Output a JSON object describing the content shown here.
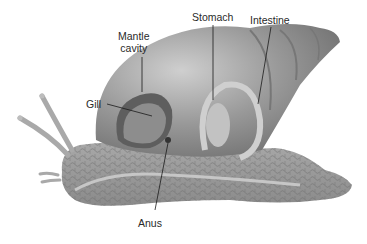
{
  "diagram": {
    "labels": [
      {
        "id": "mantle_cavity",
        "line1": "Mantle",
        "line2": "cavity"
      },
      {
        "id": "stomach",
        "text": "Stomach"
      },
      {
        "id": "intestine",
        "text": "Intestine"
      },
      {
        "id": "gill",
        "text": "Gill"
      },
      {
        "id": "anus",
        "text": "Anus"
      }
    ],
    "colors": {
      "shell": "#8a8a8a",
      "shell_light": "#c4c4c4",
      "body": "#9a9a9a",
      "body_scale_lines": "#6e6e6e",
      "leader_lines": "#1a1a1a",
      "text": "#2a2a2a"
    }
  }
}
